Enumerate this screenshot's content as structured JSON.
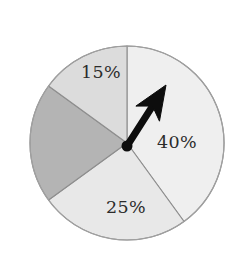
{
  "figure": {
    "background_color": "#ffffff",
    "width": 241,
    "height": 260
  },
  "chart_data": {
    "type": "pie",
    "title": "",
    "subtitle": "",
    "xlabel": "",
    "ylabel": "",
    "legend": [],
    "legend_position": "none",
    "grid": false,
    "center": {
      "x": 127,
      "y": 143
    },
    "radius": 97,
    "start_angle_deg": 0,
    "direction": "clockwise",
    "categories": [
      "40%",
      "25%",
      "unlabeled",
      "15%"
    ],
    "values": [
      40,
      25,
      20,
      15
    ],
    "labels": [
      "40%",
      "25%",
      "",
      "15%"
    ],
    "slice_colors": [
      "#efefef",
      "#e8e8e8",
      "#b4b4b4",
      "#dcdcdc"
    ],
    "slice_outline_color": "#8e8e8e",
    "slices": [
      {
        "label": "40%",
        "value": 40,
        "color": "#efefef",
        "start_deg": 0,
        "end_deg": 144,
        "label_x": 177,
        "label_y": 143,
        "label_visible": true
      },
      {
        "label": "25%",
        "value": 25,
        "color": "#e8e8e8",
        "start_deg": 144,
        "end_deg": 234,
        "label_x": 126,
        "label_y": 208,
        "label_visible": true
      },
      {
        "label": "",
        "value": 20,
        "color": "#b4b4b4",
        "start_deg": 234,
        "end_deg": 306,
        "label_x": 70,
        "label_y": 143,
        "label_visible": false
      },
      {
        "label": "15%",
        "value": 15,
        "color": "#dcdcdc",
        "start_deg": 306,
        "end_deg": 360,
        "label_x": 101,
        "label_y": 73,
        "label_visible": true
      }
    ],
    "pointer": {
      "name": "spinner-arrow",
      "color": "#0d0d0d",
      "angle_deg": 60,
      "length": 72,
      "pivot_x": 127,
      "pivot_y": 146,
      "tip_x": 166,
      "tip_y": 85
    }
  }
}
